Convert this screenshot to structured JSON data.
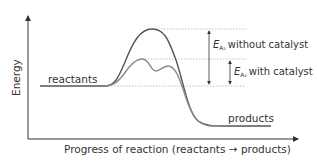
{
  "diagram": {
    "type": "energy-profile",
    "y_axis_label": "Energy",
    "x_axis_label": "Progress of reaction (reactants → products)",
    "labels": {
      "reactants": "reactants",
      "products": "products",
      "ea1_symbol": "E",
      "ea1_subscript": "A₁",
      "ea1_text": "without catalyst",
      "ea2_symbol": "E",
      "ea2_subscript": "A₂",
      "ea2_text": "with catalyst"
    },
    "curves": [
      {
        "name": "without catalyst",
        "color": "#555555",
        "peaks": 1
      },
      {
        "name": "with catalyst",
        "color": "#8a8a8a",
        "peaks": 2
      }
    ],
    "colors": {
      "axis": "#333333",
      "dashed": "#b0b0b0",
      "arrow": "#333333"
    }
  }
}
